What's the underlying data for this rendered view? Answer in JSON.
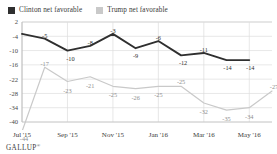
{
  "legend": {
    "entries": [
      {
        "label": "Clinton net favorable",
        "color": "#2f2f2f",
        "key": "clinton"
      },
      {
        "label": "Trump net favorable",
        "color": "#c9c9c9",
        "key": "trump"
      }
    ]
  },
  "source": {
    "brand": "GALLUP",
    "trademark": "®"
  },
  "chart_data": {
    "type": "line",
    "title": "",
    "subtitle": "",
    "xlabel": "",
    "ylabel": "",
    "grid": true,
    "legend_position": "top-left",
    "ylim": [
      -40,
      2
    ],
    "yticks": [
      2,
      -4,
      -10,
      -16,
      -22,
      -28,
      -34,
      -40
    ],
    "ytick_labels": [
      "2",
      "-4",
      "-10",
      "-16",
      "-22",
      "-28",
      "-34",
      "-40"
    ],
    "xtick_labels": [
      "Jul '15",
      "Sep '15",
      "Nov '15",
      "Jan '16",
      "Mar '16",
      "May '16"
    ],
    "xtick_indices": [
      0,
      2,
      4,
      6,
      8,
      10
    ],
    "n_points": 12,
    "series": [
      {
        "name": "Clinton net favorable",
        "color": "#2f2f2f",
        "values": [
          -3,
          -5,
          -10,
          -8,
          -3,
          -9,
          -6,
          -12,
          -11,
          -14,
          -14,
          null
        ],
        "labels": [
          "",
          "-5",
          "-10",
          "-8",
          "-3",
          "-9",
          "-6",
          "-12",
          "-11",
          "-14",
          "-14",
          ""
        ]
      },
      {
        "name": "Trump net favorable",
        "color": "#c9c9c9",
        "values": [
          -44,
          -17,
          -23,
          -21,
          -25,
          -26,
          -25,
          -25,
          -32,
          -35,
          -34,
          -27
        ],
        "labels": [
          "-44",
          "-17",
          "-23",
          "-21",
          "-25",
          "-26",
          "-25",
          "-25",
          "-32",
          "-35",
          "-34",
          "-27"
        ]
      }
    ]
  }
}
